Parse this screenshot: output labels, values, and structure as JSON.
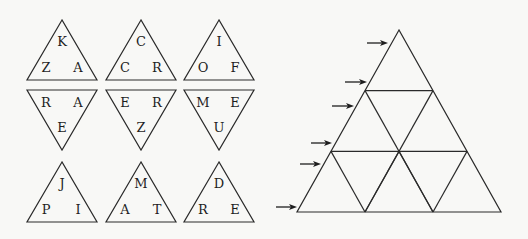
{
  "pieces": [
    {
      "id": "piece-1",
      "orientation": "up",
      "apex": [
        62,
        20
      ],
      "letters": {
        "top": "K",
        "left": "Z",
        "right": "A"
      }
    },
    {
      "id": "piece-2",
      "orientation": "up",
      "apex": [
        141,
        20
      ],
      "letters": {
        "top": "C",
        "left": "C",
        "right": "R"
      }
    },
    {
      "id": "piece-3",
      "orientation": "up",
      "apex": [
        219,
        20
      ],
      "letters": {
        "top": "I",
        "left": "O",
        "right": "F"
      }
    },
    {
      "id": "piece-4",
      "orientation": "down",
      "apex": [
        62,
        150
      ],
      "letters": {
        "left": "R",
        "right": "A",
        "bottom": "E"
      }
    },
    {
      "id": "piece-5",
      "orientation": "down",
      "apex": [
        141,
        150
      ],
      "letters": {
        "left": "E",
        "right": "R",
        "bottom": "Z"
      }
    },
    {
      "id": "piece-6",
      "orientation": "down",
      "apex": [
        219,
        150
      ],
      "letters": {
        "left": "M",
        "right": "E",
        "bottom": "U"
      }
    },
    {
      "id": "piece-7",
      "orientation": "up",
      "apex": [
        62,
        162
      ],
      "letters": {
        "top": "J",
        "left": "P",
        "right": "I"
      }
    },
    {
      "id": "piece-8",
      "orientation": "up",
      "apex": [
        141,
        162
      ],
      "letters": {
        "top": "M",
        "left": "A",
        "right": "T"
      }
    },
    {
      "id": "piece-9",
      "orientation": "up",
      "apex": [
        219,
        162
      ],
      "letters": {
        "top": "D",
        "left": "R",
        "right": "E"
      }
    }
  ],
  "board": {
    "apex": [
      399,
      30
    ],
    "bottom_left": [
      297,
      212
    ],
    "bottom_right": [
      501,
      212
    ],
    "rows": 3
  },
  "arrows": [
    {
      "x1": 367,
      "x2": 388,
      "y": 43
    },
    {
      "x1": 345,
      "x2": 367,
      "y": 82
    },
    {
      "x1": 332,
      "x2": 354,
      "y": 106
    },
    {
      "x1": 311,
      "x2": 332,
      "y": 143
    },
    {
      "x1": 300,
      "x2": 321,
      "y": 164
    },
    {
      "x1": 276,
      "x2": 297,
      "y": 207
    }
  ]
}
